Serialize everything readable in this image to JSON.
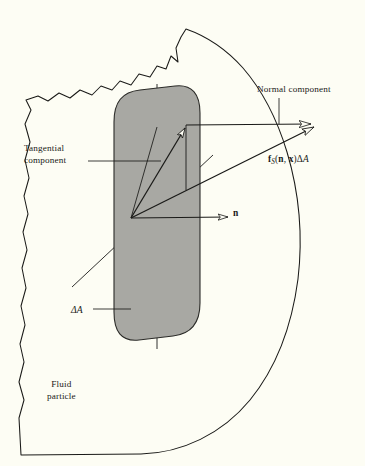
{
  "figure": {
    "background_color": "#fdfdf4",
    "line_color": "#1a1a18",
    "shaded_area_fill": "#a8a8a3",
    "shaded_area_stroke": "#2b2b28"
  },
  "labels": {
    "normal_component": "Normal component",
    "tangential_component_line1": "Tangential",
    "tangential_component_line2": "component",
    "fluid_particle_line1": "Fluid",
    "fluid_particle_line2": "particle",
    "unit_normal": "n",
    "delta_area": "ΔA",
    "force_vector": {
      "f": "f",
      "subscript": "S",
      "open_paren": "(",
      "n": "n",
      "comma": ", ",
      "x": "x",
      "close_paren": ")",
      "delta": "Δ",
      "A": "A"
    }
  },
  "elements": {
    "fluid_particle_boundary": "irregular torn outline of fluid particle",
    "cut_plane": "shaded rounded quadrilateral representing surface element",
    "vertical_axis": "vertical reference line through cut plane",
    "diagonal_axis": "diagonal reference line through cut plane",
    "vectors": [
      {
        "name": "resultant-force-vector",
        "label": "f_S(n, x)ΔA",
        "arrowhead": "hollow"
      },
      {
        "name": "normal-component-vector",
        "label": "Normal component",
        "arrowhead": "hollow"
      },
      {
        "name": "tangential-component-vector",
        "label": "Tangential component",
        "arrowhead": "hollow"
      },
      {
        "name": "unit-normal-vector",
        "label": "n",
        "arrowhead": "hollow"
      }
    ]
  }
}
